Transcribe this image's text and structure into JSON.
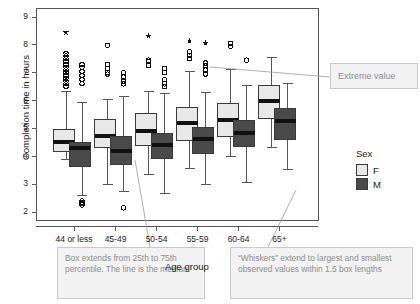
{
  "chart_data": {
    "type": "box",
    "title": "",
    "xlabel": "Age group",
    "ylabel": "Completion time in hours",
    "categories": [
      "44 or less",
      "45-49",
      "50-54",
      "55-59",
      "60-64",
      "65+"
    ],
    "ylim": [
      1.7,
      9.3
    ],
    "yticks": [
      2,
      3,
      4,
      5,
      6,
      7,
      8,
      9
    ],
    "grid": false,
    "legend": {
      "title": "Sex",
      "position": "right",
      "entries": [
        {
          "label": "F",
          "color": "#e8e8e8"
        },
        {
          "label": "M",
          "color": "#4a4a4a"
        }
      ]
    },
    "series": [
      {
        "name": "F",
        "color": "#e8e8e8",
        "boxes": [
          {
            "category": "44 or less",
            "whisker_low": 3.88,
            "q1": 4.18,
            "median": 4.52,
            "q3": 4.97,
            "whisker_high": 6.32,
            "outliers": [
              6.5,
              6.6,
              6.7,
              6.8,
              6.9,
              7.0,
              7.1,
              7.2,
              7.3,
              7.4,
              7.5,
              7.6,
              7.7
            ],
            "extremes": [
              8.45
            ]
          },
          {
            "category": "45-49",
            "whisker_low": 3.0,
            "q1": 4.3,
            "median": 4.72,
            "q3": 5.33,
            "whisker_high": 6.05,
            "outliers": [
              6.95,
              7.0,
              7.15,
              7.3,
              7.98
            ],
            "extremes": []
          },
          {
            "category": "50-54",
            "whisker_low": 3.33,
            "q1": 4.4,
            "median": 4.9,
            "q3": 5.53,
            "whisker_high": 6.33,
            "outliers": [
              7.25,
              7.4,
              7.45
            ],
            "extremes": [
              8.32
            ]
          },
          {
            "category": "55-59",
            "whisker_low": 3.55,
            "q1": 4.55,
            "median": 5.18,
            "q3": 5.75,
            "whisker_high": 7.05,
            "outliers": [
              7.5,
              7.62,
              7.75
            ],
            "extremes": [
              8.12
            ]
          },
          {
            "category": "60-64",
            "whisker_low": 3.98,
            "q1": 4.72,
            "median": 5.3,
            "q3": 5.9,
            "whisker_high": 7.1,
            "outliers": [
              7.95,
              8.05
            ],
            "extremes": []
          },
          {
            "category": "65+",
            "whisker_low": 4.3,
            "q1": 5.35,
            "median": 5.97,
            "q3": 6.55,
            "whisker_high": 7.55,
            "outliers": [],
            "extremes": []
          }
        ]
      },
      {
        "name": "M",
        "color": "#4a4a4a",
        "boxes": [
          {
            "category": "44 or less",
            "whisker_low": 2.58,
            "q1": 3.62,
            "median": 4.28,
            "q3": 4.5,
            "whisker_high": 5.92,
            "outliers": [
              2.25,
              2.3,
              2.35,
              2.4,
              6.6,
              6.75,
              6.9,
              7.05,
              7.2,
              7.3
            ],
            "extremes": []
          },
          {
            "category": "45-49",
            "whisker_low": 2.72,
            "q1": 3.72,
            "median": 4.18,
            "q3": 4.7,
            "whisker_high": 6.15,
            "outliers": [
              2.15,
              6.6,
              6.7,
              6.85,
              7.0
            ],
            "extremes": []
          },
          {
            "category": "50-54",
            "whisker_low": 2.65,
            "q1": 3.92,
            "median": 4.4,
            "q3": 4.82,
            "whisker_high": 6.25,
            "outliers": [
              6.5,
              6.6,
              6.75,
              7.0,
              7.15
            ],
            "extremes": []
          },
          {
            "category": "55-59",
            "whisker_low": 2.98,
            "q1": 4.1,
            "median": 4.62,
            "q3": 5.02,
            "whisker_high": 6.3,
            "outliers": [
              6.95,
              7.1,
              7.25,
              7.35
            ],
            "extremes": [
              8.05
            ]
          },
          {
            "category": "60-64",
            "whisker_low": 3.05,
            "q1": 4.35,
            "median": 4.82,
            "q3": 5.3,
            "whisker_high": 6.55,
            "outliers": [
              7.45
            ],
            "extremes": []
          },
          {
            "category": "65+",
            "whisker_low": 3.52,
            "q1": 4.62,
            "median": 5.28,
            "q3": 5.72,
            "whisker_high": 6.62,
            "outliers": [],
            "extremes": []
          }
        ]
      }
    ],
    "annotations": [
      {
        "id": "extreme",
        "text": "Extreme value"
      },
      {
        "id": "box",
        "text": "Box extends from 25th to 75th percentile. The line is the median."
      },
      {
        "id": "whiskers",
        "text": "“Whiskers” extend to largest and smallest observed values within 1.5 box lengths"
      }
    ]
  }
}
